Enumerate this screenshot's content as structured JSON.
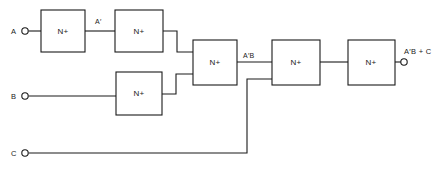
{
  "diagram": {
    "background_color": "#ffffff",
    "line_color": "#1a1a1a",
    "gate_text": "N+",
    "gates": [
      {
        "id": "gate-a-inverter",
        "label": "N+",
        "x": 41,
        "y": 10,
        "w": 44,
        "h": 42
      },
      {
        "id": "gate-a-second",
        "label": "N+",
        "x": 115,
        "y": 10,
        "w": 48,
        "h": 42
      },
      {
        "id": "gate-b-inverter",
        "label": "N+",
        "x": 116,
        "y": 72,
        "w": 46,
        "h": 43
      },
      {
        "id": "gate-and-ab",
        "label": "N+",
        "x": 193,
        "y": 40,
        "w": 44,
        "h": 45
      },
      {
        "id": "gate-or-c",
        "label": "N+",
        "x": 272,
        "y": 40,
        "w": 48,
        "h": 45
      },
      {
        "id": "gate-output",
        "label": "N+",
        "x": 348,
        "y": 40,
        "w": 47,
        "h": 45
      }
    ],
    "inputs": [
      {
        "id": "input-a",
        "label": "A",
        "label_x": 11,
        "label_y": 34,
        "cx": 25,
        "cy": 31
      },
      {
        "id": "input-b",
        "label": "B",
        "label_x": 11,
        "label_y": 99,
        "cx": 25,
        "cy": 96
      },
      {
        "id": "input-c",
        "label": "C",
        "label_x": 11,
        "label_y": 156,
        "cx": 25,
        "cy": 153
      }
    ],
    "outputs": [
      {
        "id": "output-f",
        "label": "A′B + C",
        "label_x": 404,
        "label_y": 54,
        "cx": 404,
        "cy": 62
      }
    ],
    "wire_labels": [
      {
        "id": "label-a-not",
        "text": "A′",
        "x": 95,
        "y": 24
      },
      {
        "id": "label-a-not-b",
        "text": "A′B",
        "x": 243,
        "y": 58
      }
    ]
  }
}
